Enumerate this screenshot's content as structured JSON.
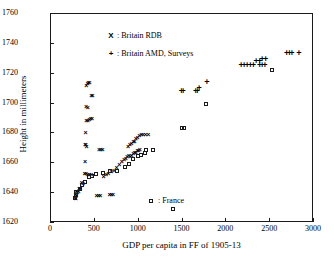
{
  "chart_data": {
    "type": "scatter",
    "title": "",
    "xlabel": "GDP per capita in FF of 1905-13",
    "ylabel": "Height in millimeters",
    "xlim": [
      0,
      3000
    ],
    "ylim": [
      1620,
      1760
    ],
    "xticks": [
      0,
      500,
      1000,
      1500,
      2000,
      2500,
      3000
    ],
    "yticks": [
      1620,
      1640,
      1660,
      1680,
      1700,
      1720,
      1740,
      1760
    ],
    "grid": false,
    "legend_position": "inside-upper-left",
    "series": [
      {
        "name": "Britain RDB",
        "marker": "x",
        "legend_symbol": "X",
        "legend_label": "X : Britain RDB",
        "points": [
          [
            415,
            1712
          ],
          [
            428,
            1713
          ],
          [
            438,
            1714
          ],
          [
            450,
            1714
          ],
          [
            470,
            1705
          ],
          [
            485,
            1705
          ],
          [
            410,
            1698
          ],
          [
            430,
            1697
          ],
          [
            415,
            1688
          ],
          [
            432,
            1688
          ],
          [
            448,
            1689
          ],
          [
            462,
            1690
          ],
          [
            480,
            1690
          ],
          [
            405,
            1680
          ],
          [
            400,
            1672
          ],
          [
            408,
            1672
          ],
          [
            418,
            1671
          ],
          [
            560,
            1669
          ],
          [
            580,
            1669
          ],
          [
            600,
            1669
          ],
          [
            400,
            1661
          ],
          [
            395,
            1653
          ],
          [
            412,
            1653
          ],
          [
            430,
            1652
          ],
          [
            448,
            1652
          ],
          [
            470,
            1652
          ],
          [
            360,
            1647
          ],
          [
            378,
            1646
          ],
          [
            330,
            1643
          ],
          [
            345,
            1643
          ],
          [
            300,
            1641
          ],
          [
            312,
            1640
          ],
          [
            325,
            1641
          ],
          [
            290,
            1639
          ],
          [
            300,
            1638
          ],
          [
            285,
            1637
          ],
          [
            295,
            1636
          ],
          [
            530,
            1638
          ],
          [
            555,
            1638
          ],
          [
            575,
            1638
          ],
          [
            680,
            1639
          ],
          [
            700,
            1639
          ],
          [
            720,
            1639
          ],
          [
            610,
            1651
          ],
          [
            640,
            1652
          ],
          [
            665,
            1653
          ],
          [
            700,
            1654
          ],
          [
            730,
            1655
          ],
          [
            760,
            1657
          ],
          [
            790,
            1659
          ],
          [
            820,
            1661
          ],
          [
            845,
            1662
          ],
          [
            865,
            1663
          ],
          [
            880,
            1664
          ],
          [
            900,
            1665
          ],
          [
            915,
            1664
          ],
          [
            930,
            1665
          ],
          [
            950,
            1666
          ],
          [
            965,
            1667
          ],
          [
            980,
            1667
          ],
          [
            995,
            1668
          ],
          [
            1010,
            1668
          ],
          [
            1025,
            1669
          ],
          [
            890,
            1671
          ],
          [
            910,
            1672
          ],
          [
            930,
            1673
          ],
          [
            950,
            1674
          ],
          [
            965,
            1674
          ],
          [
            980,
            1676
          ],
          [
            1000,
            1677
          ],
          [
            1020,
            1678
          ],
          [
            1040,
            1679
          ],
          [
            1060,
            1679
          ],
          [
            1090,
            1679
          ],
          [
            1120,
            1679
          ]
        ]
      },
      {
        "name": "Britain AMD, Surveys",
        "marker": "plus",
        "legend_symbol": "+",
        "legend_label": "+ : Britain AMD, Surveys",
        "points": [
          [
            1500,
            1708
          ],
          [
            1520,
            1708
          ],
          [
            1660,
            1708
          ],
          [
            1680,
            1708
          ],
          [
            1700,
            1710
          ],
          [
            1790,
            1714
          ],
          [
            2180,
            1725
          ],
          [
            2215,
            1725
          ],
          [
            2250,
            1725
          ],
          [
            2285,
            1725
          ],
          [
            2320,
            1725
          ],
          [
            2350,
            1728
          ],
          [
            2390,
            1728
          ],
          [
            2420,
            1729
          ],
          [
            2460,
            1729
          ],
          [
            2390,
            1725
          ],
          [
            2420,
            1725
          ],
          [
            2450,
            1725
          ],
          [
            2700,
            1733
          ],
          [
            2730,
            1733
          ],
          [
            2760,
            1733
          ],
          [
            2840,
            1733
          ]
        ]
      },
      {
        "name": "France",
        "marker": "square",
        "legend_symbol": "square",
        "legend_label": ": France",
        "points": [
          [
            290,
            1636
          ],
          [
            295,
            1638
          ],
          [
            300,
            1640
          ],
          [
            340,
            1642
          ],
          [
            370,
            1645
          ],
          [
            400,
            1647
          ],
          [
            440,
            1650
          ],
          [
            480,
            1651
          ],
          [
            520,
            1652
          ],
          [
            600,
            1653
          ],
          [
            680,
            1654
          ],
          [
            760,
            1654
          ],
          [
            850,
            1657
          ],
          [
            900,
            1659
          ],
          [
            950,
            1662
          ],
          [
            1000,
            1664
          ],
          [
            1040,
            1665
          ],
          [
            1080,
            1666
          ],
          [
            1100,
            1668
          ],
          [
            1170,
            1668
          ],
          [
            1400,
            1629
          ],
          [
            1500,
            1683
          ],
          [
            1530,
            1683
          ],
          [
            1780,
            1699
          ],
          [
            2530,
            1722
          ]
        ]
      }
    ]
  },
  "axis": {
    "xtick_labels": [
      "0",
      "500",
      "1000",
      "1500",
      "2000",
      "2500",
      "3000"
    ],
    "ytick_labels": [
      "1620",
      "1640",
      "1660",
      "1680",
      "1700",
      "1720",
      "1740",
      "1760"
    ],
    "xlabel": "GDP per capita in FF of 1905-13",
    "ylabel": "Height in millimeters"
  },
  "legend": {
    "rdb_symbol": "X",
    "rdb_separator": ":",
    "rdb_label": "Britain RDB",
    "amd_symbol": "+",
    "amd_separator": ":",
    "amd_label": "Britain AMD, Surveys",
    "france_separator": ":",
    "france_label": "France"
  },
  "colors": {
    "axis": "#1a1a1a",
    "marker": "#000000",
    "background": "#ffffff"
  }
}
